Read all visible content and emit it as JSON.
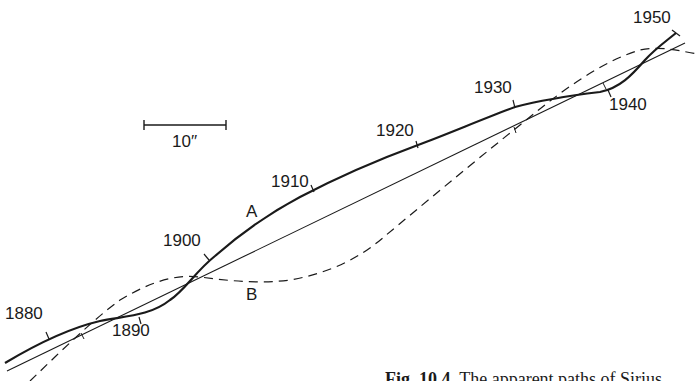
{
  "figure": {
    "caption_number": "Fig. 10.4.",
    "caption_text": " The apparent paths of Sirius"
  },
  "scale_bar": {
    "label": "10′′",
    "length_px": 82
  },
  "curves": {
    "A": {
      "label": "A",
      "style": "solid-thick",
      "description": "apparent path of Sirius A"
    },
    "B": {
      "label": "B",
      "style": "dashed",
      "description": "apparent path of Sirius B"
    },
    "centre_of_mass": {
      "style": "solid-thin",
      "description": "straight path of centre of mass"
    }
  },
  "year_labels": [
    {
      "year": "1880",
      "x": 5,
      "y": 305
    },
    {
      "year": "1890",
      "x": 112,
      "y": 320
    },
    {
      "year": "1900",
      "x": 163,
      "y": 232
    },
    {
      "year": "1910",
      "x": 271,
      "y": 173
    },
    {
      "year": "1920",
      "x": 376,
      "y": 122
    },
    {
      "year": "1930",
      "x": 474,
      "y": 79
    },
    {
      "year": "1940",
      "x": 609,
      "y": 96
    },
    {
      "year": "1950",
      "x": 633,
      "y": 9
    }
  ],
  "curve_labels": [
    {
      "text": "A",
      "x": 246,
      "y": 203
    },
    {
      "text": "B",
      "x": 246,
      "y": 286
    }
  ],
  "colors": {
    "ink": "#1a1a1a",
    "background": "#ffffff"
  }
}
